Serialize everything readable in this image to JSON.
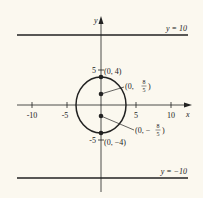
{
  "axes": {
    "x_label": "x",
    "y_label": "y",
    "x_ticks": [
      "-10",
      "-5",
      "5",
      "10"
    ],
    "y_ticks": [
      "5",
      "-5"
    ]
  },
  "lines": {
    "top": "y = 10",
    "bottom": "y = −10"
  },
  "points": {
    "top_vertex": "(0, 4)",
    "bottom_vertex": "(0, −4)",
    "focus_top_prefix": "(0,",
    "focus_top_num": "8",
    "focus_top_den": "5",
    "focus_bottom_prefix": "(0, −",
    "focus_bottom_num": "8",
    "focus_bottom_den": "5"
  },
  "colors": {
    "ink": "#222222",
    "background": "#fbf8ef"
  }
}
